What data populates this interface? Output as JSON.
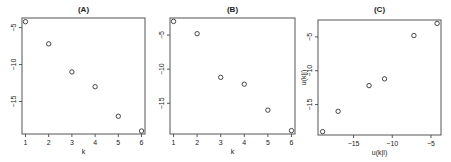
{
  "chart_data": [
    {
      "type": "scatter",
      "title": "(A)",
      "xlabel": "k",
      "ylabel": "",
      "x": [
        1,
        2,
        3,
        4,
        5,
        6
      ],
      "y": [
        -4.2,
        -7.2,
        -11.0,
        -13.0,
        -17.0,
        -19.0
      ],
      "xlim": [
        0.85,
        6.15
      ],
      "ylim": [
        -19.4,
        -3.7
      ],
      "xticks": [
        1,
        2,
        3,
        4,
        5,
        6
      ],
      "yticks": [
        -5,
        -10,
        -15
      ],
      "ytick_labels": [
        "-5",
        "-10",
        "-15"
      ],
      "grid": false,
      "marker": "open-circle"
    },
    {
      "type": "scatter",
      "title": "(B)",
      "xlabel": "k",
      "ylabel": "",
      "x": [
        1,
        2,
        3,
        4,
        5,
        6
      ],
      "y": [
        -3.0,
        -4.8,
        -11.2,
        -12.2,
        -16.0,
        -19.0
      ],
      "xlim": [
        0.85,
        6.15
      ],
      "ylim": [
        -19.5,
        -2.5
      ],
      "xticks": [
        1,
        2,
        3,
        4,
        5,
        6
      ],
      "yticks": [
        -5,
        -10,
        -15
      ],
      "ytick_labels": [
        "-5",
        "-10",
        "-15"
      ],
      "grid": false,
      "marker": "open-circle"
    },
    {
      "type": "scatter",
      "title": "(C)",
      "xlabel": "u(k|l)",
      "ylabel": "u(k|j)",
      "x": [
        -19.0,
        -17.0,
        -13.0,
        -11.0,
        -7.2,
        -4.2
      ],
      "y": [
        -19.0,
        -16.0,
        -12.2,
        -11.2,
        -4.8,
        -3.0
      ],
      "xlim": [
        -19.6,
        -3.7
      ],
      "ylim": [
        -19.5,
        -2.5
      ],
      "xticks": [
        -15,
        -10,
        -5
      ],
      "xtick_labels": [
        "-15",
        "-10",
        "-5"
      ],
      "yticks": [
        -5,
        -10,
        -15
      ],
      "ytick_labels": [
        "-5",
        "-10",
        "-15"
      ],
      "grid": false,
      "marker": "open-circle"
    }
  ],
  "panels": [
    {
      "title": "(A)",
      "xlabel": "k",
      "ylabel": ""
    },
    {
      "title": "(B)",
      "xlabel": "k",
      "ylabel": ""
    },
    {
      "title": "(C)",
      "xlabel": "u(k|l)",
      "ylabel": "u(k|j)"
    }
  ],
  "colors": {
    "axis": "#555555",
    "marker": "#333333",
    "text": "#222222"
  }
}
